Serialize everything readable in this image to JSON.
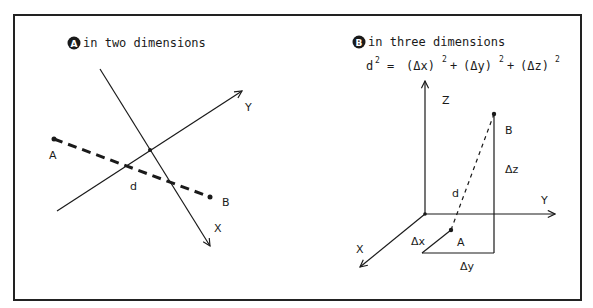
{
  "panel_a": {
    "badge": "A",
    "title": "in two dimensions",
    "labels": {
      "axis_x": "X",
      "axis_y": "Y",
      "point_a": "A",
      "point_b": "B",
      "distance": "d"
    }
  },
  "panel_b": {
    "badge": "B",
    "title": "in three dimensions",
    "formula": {
      "lhs": "d",
      "lhs_exp": "2",
      "eq": "=",
      "t1": "(Δx)",
      "t2": "(Δy)",
      "t3": "(Δz)",
      "exp": "2",
      "plus": "+"
    },
    "labels": {
      "axis_x": "X",
      "axis_y": "Y",
      "axis_z": "Z",
      "point_a": "A",
      "point_b": "B",
      "distance": "d",
      "delta_x": "Δx",
      "delta_y": "Δy",
      "delta_z": "Δz"
    }
  },
  "colors": {
    "ink": "#1a1a1a",
    "background": "#ffffff"
  }
}
